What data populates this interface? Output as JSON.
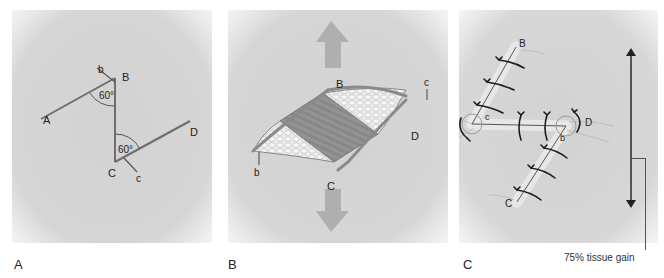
{
  "figure": {
    "panels": [
      {
        "id": "A",
        "caption_letter": "A",
        "point_labels": {
          "A": "A",
          "B": "B",
          "C": "C",
          "D": "D",
          "b": "b",
          "c": "c"
        },
        "angles": [
          "60°",
          "60°"
        ]
      },
      {
        "id": "B",
        "caption_letter": "B",
        "point_labels": {
          "B": "B",
          "C": "C",
          "D": "D",
          "b": "b",
          "c": "c"
        }
      },
      {
        "id": "C",
        "caption_letter": "C",
        "point_labels": {
          "A": "A",
          "B": "B",
          "C": "C",
          "D": "D",
          "b": "b",
          "c": "c"
        },
        "annotation": "75% tissue gain"
      }
    ],
    "colors": {
      "background": "#d4d4d4",
      "line": "#6e6e6e",
      "suture": "#1c1c1c",
      "arrow": "#a8a8a8",
      "fat": "#ededed",
      "muscle": "#8f8f8f"
    }
  }
}
